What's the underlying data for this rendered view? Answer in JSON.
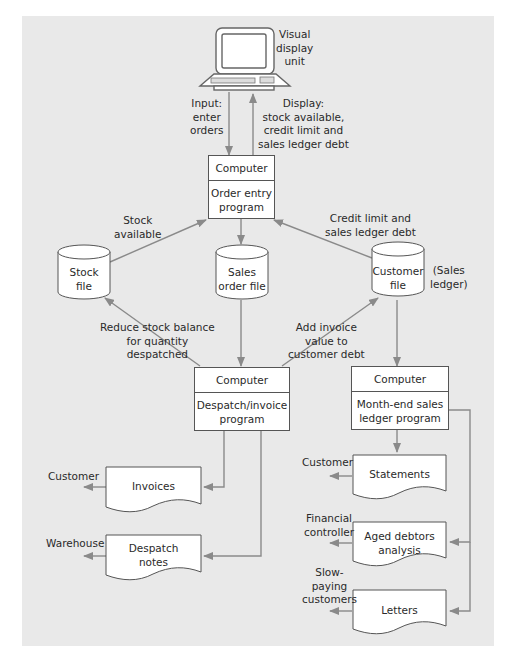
{
  "diagram": {
    "type": "system-flowchart",
    "colors": {
      "background_panel": "#e9e9e9",
      "box_fill": "#ffffff",
      "box_border": "#555555",
      "arrow": "#8a8a8a",
      "text": "#2a2a2a"
    },
    "vdu": {
      "label_1": "Visual",
      "label_2": "display",
      "label_3": "unit"
    },
    "flows": {
      "input": [
        "Input:",
        "enter",
        "orders"
      ],
      "display": [
        "Display:",
        "stock available,",
        "credit limit and",
        "sales ledger debt"
      ],
      "stock_available": [
        "Stock",
        "available"
      ],
      "credit_limit": [
        "Credit limit and",
        "sales ledger debt"
      ],
      "reduce_stock": [
        "Reduce stock balance",
        "for quantity",
        "despatched"
      ],
      "add_invoice": [
        "Add invoice",
        "value to",
        "customer debt"
      ]
    },
    "processes": {
      "order_entry": {
        "head": "Computer",
        "line1": "Order entry",
        "line2": "program"
      },
      "despatch": {
        "head": "Computer",
        "line1": "Despatch/invoice",
        "line2": "program"
      },
      "month_end": {
        "head": "Computer",
        "line1": "Month-end sales",
        "line2": "ledger program"
      }
    },
    "files": {
      "stock": {
        "line1": "Stock",
        "line2": "file"
      },
      "sales_order": {
        "line1": "Sales",
        "line2": "order file"
      },
      "customer": {
        "line1": "Customer",
        "line2": "file",
        "note_1": "(Sales",
        "note_2": "ledger)"
      }
    },
    "documents": {
      "invoices": {
        "label": "Invoices",
        "recipient": "Customer"
      },
      "despatch_notes": {
        "line1": "Despatch",
        "line2": "notes",
        "recipient": "Warehouse"
      },
      "statements": {
        "label": "Statements",
        "recipient": "Customer"
      },
      "aged_debtors": {
        "line1": "Aged debtors",
        "line2": "analysis",
        "recipient_1": "Financial",
        "recipient_2": "controller"
      },
      "letters": {
        "label": "Letters",
        "recipient_1": "Slow-",
        "recipient_2": "paying",
        "recipient_3": "customers"
      }
    }
  }
}
